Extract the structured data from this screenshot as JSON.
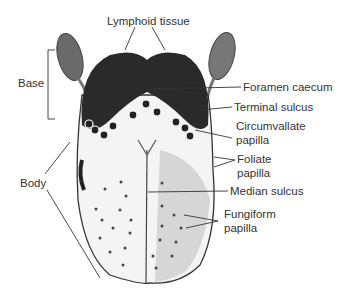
{
  "diagram": {
    "labels": {
      "lymphoid_tissue": "Lymphoid tissue",
      "foramen_caecum": "Foramen caecum",
      "terminal_sulcus": "Terminal sulcus",
      "circumvallate_1": "Circumvallate",
      "circumvallate_2": "papilla",
      "foliate_1": "Foliate",
      "foliate_2": "papilla",
      "median_sulcus": "Median sulcus",
      "fungiform_1": "Fungiform",
      "fungiform_2": "papilla",
      "base": "Base",
      "body": "Body"
    }
  }
}
